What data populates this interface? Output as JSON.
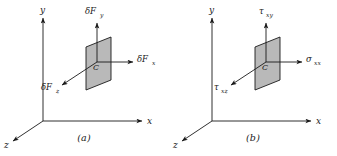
{
  "figure": {
    "panels": [
      {
        "id": "a",
        "caption": "(a)",
        "axes": {
          "y_label": "y",
          "x_label": "x",
          "z_label": "z"
        },
        "element": {
          "center_label": "C",
          "fill_color": "#b9b9b9",
          "stroke_color": "#1a1a1a"
        },
        "vectors": [
          {
            "name": "delta-F-y",
            "base": "δF",
            "subscript": "y",
            "direction": "up"
          },
          {
            "name": "delta-F-x",
            "base": "δF",
            "subscript": "x",
            "direction": "right"
          },
          {
            "name": "delta-F-z",
            "base": "δF",
            "subscript": "z",
            "direction": "down-left"
          }
        ]
      },
      {
        "id": "b",
        "caption": "(b)",
        "axes": {
          "y_label": "y",
          "x_label": "x",
          "z_label": "z"
        },
        "element": {
          "center_label": "C",
          "fill_color": "#b9b9b9",
          "stroke_color": "#1a1a1a"
        },
        "vectors": [
          {
            "name": "tau-xy",
            "base": "τ",
            "subscript": "xy",
            "direction": "up"
          },
          {
            "name": "sigma-xx",
            "base": "σ",
            "subscript": "xx",
            "direction": "right"
          },
          {
            "name": "tau-xz",
            "base": "τ",
            "subscript": "xz",
            "direction": "down-left"
          }
        ]
      }
    ],
    "colors": {
      "background": "#ffffff",
      "ink": "#1a1a1a",
      "element_fill": "#b9b9b9"
    }
  }
}
